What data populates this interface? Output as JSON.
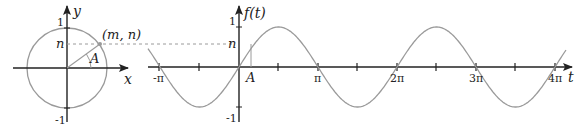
{
  "colors": {
    "axis": "#222222",
    "curve": "#9a9a9a",
    "dashed": "#9a9a9a",
    "background": "#ffffff"
  },
  "unit_circle": {
    "x_axis_label": "x",
    "y_axis_label": "y",
    "tick_top": "1",
    "tick_bottom": "-1",
    "n_label": "n",
    "point_label": "(m, n)",
    "angle_label": "A"
  },
  "wave_graph": {
    "y_axis_label": "f(t)",
    "x_axis_label": "t",
    "tick_top": "1",
    "tick_bottom": "-1",
    "n_label": "n",
    "angle_label": "A",
    "x_ticks": [
      "-π",
      "π",
      "2π",
      "3π",
      "4π"
    ]
  },
  "chart_data": {
    "type": "line",
    "title": "",
    "xlabel": "t",
    "ylabel": "f(t)",
    "function": "sin(t)",
    "x_range": [
      "-1.15π",
      "4.15π"
    ],
    "ylim": [
      -1,
      1
    ],
    "x_tick_labels": [
      "-π",
      "π",
      "2π",
      "3π",
      "4π"
    ],
    "annotations": [
      "n",
      "A",
      "(m, n)"
    ]
  }
}
